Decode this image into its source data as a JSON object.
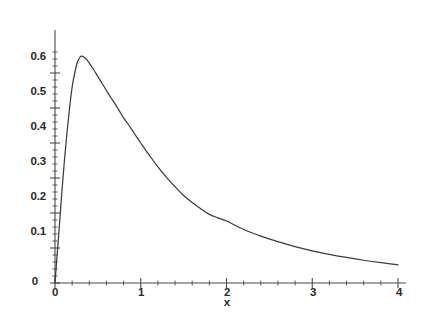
{
  "chart_data": {
    "type": "line",
    "title": "",
    "subtitle": "",
    "xlabel": "x",
    "ylabel": "",
    "xlim": [
      0,
      4
    ],
    "ylim": [
      0,
      0.68
    ],
    "grid": false,
    "legend": null,
    "x_ticks": [
      "0",
      "1",
      "2",
      "3",
      "4"
    ],
    "x_tick_values": [
      0,
      1,
      2,
      3,
      4
    ],
    "x_minor_step": 0.2,
    "y_ticks": [
      "0",
      "0.1",
      "0.2",
      "0.3",
      "0.4",
      "0.5",
      "0.6"
    ],
    "y_tick_values": [
      0,
      0.1,
      0.2,
      0.3,
      0.4,
      0.5,
      0.6
    ],
    "y_minor_step": 0.02,
    "series": [
      {
        "name": "density",
        "color": "#3c3c3c",
        "x": [
          0.0,
          0.02,
          0.05,
          0.08,
          0.11,
          0.14,
          0.17,
          0.2,
          0.23,
          0.26,
          0.29,
          0.31,
          0.34,
          0.37,
          0.4,
          0.45,
          0.5,
          0.55,
          0.6,
          0.65,
          0.7,
          0.75,
          0.8,
          0.85,
          0.9,
          0.95,
          1.0,
          1.1,
          1.2,
          1.3,
          1.4,
          1.5,
          1.6,
          1.7,
          1.8,
          1.9,
          2.0,
          2.2,
          2.4,
          2.6,
          2.8,
          3.0,
          3.2,
          3.4,
          3.6,
          3.8,
          4.0
        ],
        "y": [
          0.0,
          0.065,
          0.16,
          0.26,
          0.35,
          0.43,
          0.5,
          0.56,
          0.6,
          0.63,
          0.645,
          0.648,
          0.645,
          0.638,
          0.628,
          0.61,
          0.59,
          0.57,
          0.55,
          0.53,
          0.512,
          0.492,
          0.472,
          0.455,
          0.437,
          0.418,
          0.4,
          0.365,
          0.332,
          0.302,
          0.275,
          0.25,
          0.23,
          0.212,
          0.196,
          0.186,
          0.177,
          0.153,
          0.134,
          0.118,
          0.104,
          0.092,
          0.082,
          0.073,
          0.065,
          0.058,
          0.052
        ]
      }
    ],
    "annotations": [
      {
        "text": "0",
        "role": "origin-x-tick"
      },
      {
        "text": "0",
        "role": "origin-y-tick"
      }
    ]
  },
  "axes": {
    "y_labels": [
      "0.6",
      "0.5",
      "0.4",
      "0.3",
      "0.2",
      "0.1",
      "0"
    ],
    "x_labels": [
      "0",
      "1",
      "2",
      "3",
      "4"
    ],
    "x_axis_title": "x"
  },
  "colors": {
    "curve": "#3c3c3c",
    "axis": "#4a4a4a",
    "text": "#2a2a2a",
    "background": "#ffffff"
  }
}
